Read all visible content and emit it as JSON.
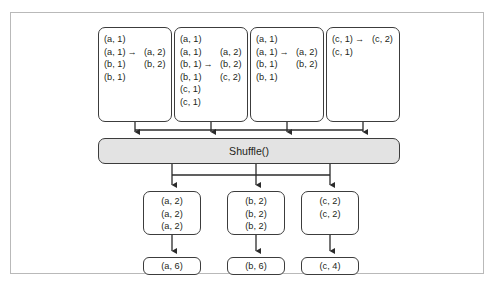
{
  "figure": {
    "shuffle_label": "Shuffle()",
    "map_outputs": [
      {
        "name": "mapper-output-1",
        "rows": [
          {
            "lhs": "(a, 1)",
            "arrow": "",
            "rhs": ""
          },
          {
            "lhs": "(a, 1)",
            "arrow": "→",
            "rhs": "(a, 2)"
          },
          {
            "lhs": "(b, 1)",
            "arrow": "",
            "rhs": "(b, 2)"
          },
          {
            "lhs": "(b, 1)",
            "arrow": "",
            "rhs": ""
          }
        ]
      },
      {
        "name": "mapper-output-2",
        "rows": [
          {
            "lhs": "(a, 1)",
            "arrow": "",
            "rhs": ""
          },
          {
            "lhs": "(a, 1)",
            "arrow": "",
            "rhs": "(a, 2)"
          },
          {
            "lhs": "(b, 1)",
            "arrow": "→",
            "rhs": "(b, 2)"
          },
          {
            "lhs": "(b, 1)",
            "arrow": "",
            "rhs": "(c, 2)"
          },
          {
            "lhs": "(c, 1)",
            "arrow": "",
            "rhs": ""
          },
          {
            "lhs": "(c, 1)",
            "arrow": "",
            "rhs": ""
          }
        ]
      },
      {
        "name": "mapper-output-3",
        "rows": [
          {
            "lhs": "(a, 1)",
            "arrow": "",
            "rhs": ""
          },
          {
            "lhs": "(a, 1)",
            "arrow": "→",
            "rhs": "(a, 2)"
          },
          {
            "lhs": "(b, 1)",
            "arrow": "",
            "rhs": "(b, 2)"
          },
          {
            "lhs": "(b, 1)",
            "arrow": "",
            "rhs": ""
          }
        ]
      },
      {
        "name": "mapper-output-4",
        "rows": [
          {
            "lhs": "(c, 1)",
            "arrow": "→",
            "rhs": "(c, 2)"
          },
          {
            "lhs": "(c, 1)",
            "arrow": "",
            "rhs": ""
          }
        ]
      }
    ],
    "reducer_inputs": [
      {
        "name": "reducer-input-a",
        "rows": [
          "(a, 2)",
          "(a, 2)",
          "(a, 2)"
        ]
      },
      {
        "name": "reducer-input-b",
        "rows": [
          "(b, 2)",
          "(b, 2)",
          "(b, 2)"
        ]
      },
      {
        "name": "reducer-input-c",
        "rows": [
          "(c, 2)",
          "(c, 2)"
        ]
      }
    ],
    "final_outputs": [
      {
        "name": "final-output-a",
        "label": "(a, 6)"
      },
      {
        "name": "final-output-b",
        "label": "(b, 6)"
      },
      {
        "name": "final-output-c",
        "label": "(c, 4)"
      }
    ],
    "colors": {
      "frame_border": "#b9b9b9",
      "box_border": "#3c3c3c",
      "shuffle_fill": "#e3e3e3",
      "text": "#231f20"
    }
  }
}
